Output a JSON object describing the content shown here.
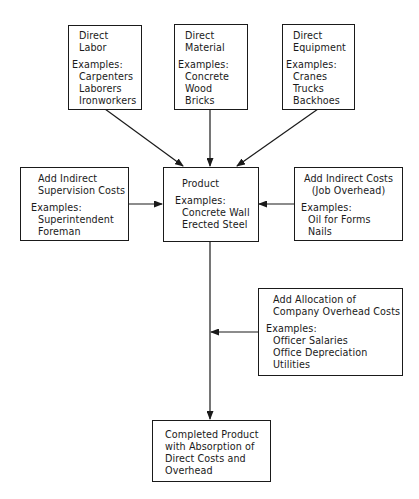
{
  "diagram": {
    "direct_labor": {
      "title": [
        "Direct",
        "Labor"
      ],
      "examples_label": "Examples:",
      "examples": [
        "Carpenters",
        "Laborers",
        "Ironworkers"
      ]
    },
    "direct_material": {
      "title": [
        "Direct",
        "Material"
      ],
      "examples_label": "Examples:",
      "examples": [
        "Concrete",
        "Wood",
        "Bricks"
      ]
    },
    "direct_equipment": {
      "title": [
        "Direct",
        "Equipment"
      ],
      "examples_label": "Examples:",
      "examples": [
        "Cranes",
        "Trucks",
        "Backhoes"
      ]
    },
    "indirect_supervision": {
      "title": [
        "Add Indirect",
        "Supervision Costs"
      ],
      "examples_label": "Examples:",
      "examples": [
        "Superintendent",
        "Foreman"
      ]
    },
    "product": {
      "title": [
        "Product"
      ],
      "examples_label": "Examples:",
      "examples": [
        "Concrete Wall",
        "Erected Steel"
      ]
    },
    "indirect_job_overhead": {
      "title": [
        "Add Indirect Costs",
        "(Job Overhead)"
      ],
      "examples_label": "Examples:",
      "examples": [
        "Oil for Forms",
        "Nails"
      ]
    },
    "company_overhead": {
      "title": [
        "Add Allocation of",
        "Company Overhead Costs"
      ],
      "examples_label": "Examples:",
      "examples": [
        "Officer Salaries",
        "Office Depreciation",
        "Utilities"
      ]
    },
    "completed_product": {
      "title": [
        "Completed Product",
        "with Absorption of",
        "Direct Costs and",
        "Overhead"
      ]
    },
    "colors": {
      "stroke": "#1a1a1a",
      "background": "#ffffff"
    }
  }
}
